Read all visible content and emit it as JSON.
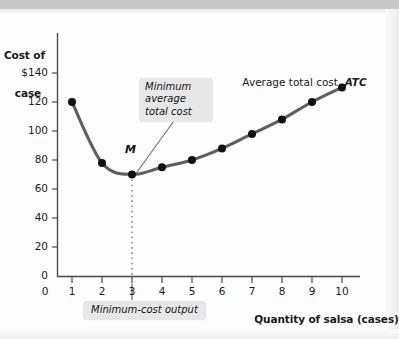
{
  "figure": {
    "background_color": "#fdfdfd",
    "curve_color": "#5f5f5f",
    "point_color": "#111111",
    "callout_bg": "#e7e7e7"
  },
  "axes": {
    "y_title_line1": "Cost of",
    "y_title_line2": "case",
    "x_title": "Quantity of salsa (cases)",
    "y_ticks": [
      "$140",
      "120",
      "100",
      "80",
      "60",
      "40",
      "20",
      "0"
    ],
    "x_ticks": [
      "0",
      "1",
      "2",
      "3",
      "4",
      "5",
      "6",
      "7",
      "8",
      "9",
      "10"
    ]
  },
  "annotations": {
    "curve_label_prefix": "Average total cost, ",
    "curve_label_symbol": "ATC",
    "minimum_point_label": "M",
    "callout_min_atc_line1": "Minimum",
    "callout_min_atc_line2": "average",
    "callout_min_atc_line3": "total cost",
    "callout_min_output": "Minimum-cost output"
  },
  "chart_data": {
    "type": "line",
    "title": "",
    "subtitle": "",
    "xlabel": "Quantity of salsa (cases)",
    "ylabel": "Cost of case",
    "xlim": [
      0,
      10.6
    ],
    "ylim": [
      0,
      150
    ],
    "grid": false,
    "legend_position": "inline-right",
    "x": [
      1,
      2,
      3,
      4,
      5,
      6,
      7,
      8,
      9,
      10
    ],
    "series": [
      {
        "name": "Average total cost, ATC",
        "values": [
          120,
          78,
          70,
          75,
          80,
          88,
          98,
          108,
          120,
          130
        ],
        "color": "#5f5f5f",
        "marker": "circle"
      }
    ],
    "markers": [
      {
        "name": "M",
        "x": 3,
        "y": 70,
        "note": "Minimum average total cost"
      }
    ],
    "reference_lines": [
      {
        "name": "minimum-cost-output",
        "orientation": "vertical",
        "x": 3,
        "style": "dotted",
        "label": "Minimum-cost output"
      }
    ],
    "annotations": [
      {
        "text": "Minimum average total cost",
        "target_x": 3,
        "target_y": 70
      },
      {
        "text": "Minimum-cost output",
        "target_x": 3,
        "target_y": 0
      },
      {
        "text": "Average total cost, ATC",
        "target_x": 9,
        "target_y": 138
      }
    ]
  }
}
